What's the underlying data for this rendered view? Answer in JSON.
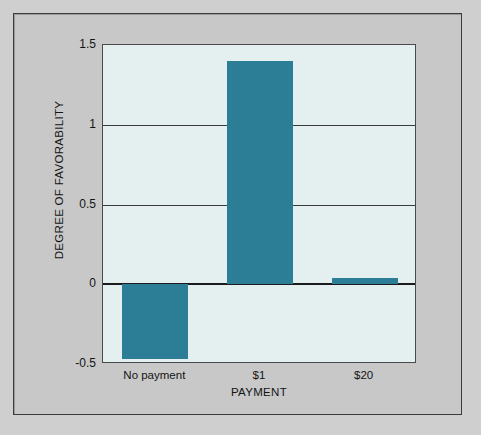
{
  "chart_data": {
    "type": "bar",
    "title": "",
    "subtitle": "",
    "categories": [
      "No payment",
      "$1",
      "$20"
    ],
    "values": [
      -0.47,
      1.4,
      0.04
    ],
    "series": [
      {
        "name": "Degree of favorability",
        "values": [
          -0.47,
          1.4,
          0.04
        ]
      }
    ],
    "xlabel": "PAYMENT",
    "ylabel": "DEGREE OF FAVORABILITY",
    "ylim": [
      -0.5,
      1.5
    ],
    "yticks": [
      1.5,
      1,
      0.5,
      0,
      -0.5
    ],
    "ytick_labels": [
      "1.5",
      "1",
      "0.5",
      "0",
      "-0.5"
    ],
    "grid": true,
    "grid_axis": "y",
    "legend": false,
    "legend_position": "none",
    "bar_color": "#2b7e95",
    "plot_background": "#e4eff0",
    "figure_background": "#c8c8c8",
    "axis_color": "#3a3a3a",
    "zero_line_color": "#1c1c1c"
  },
  "axes": {
    "y_title": "DEGREE OF FAVORABILITY",
    "x_title": "PAYMENT"
  },
  "yticks": [
    {
      "label": "1.5",
      "value": 1.5
    },
    {
      "label": "1",
      "value": 1
    },
    {
      "label": "0.5",
      "value": 0.5
    },
    {
      "label": "0",
      "value": 0
    },
    {
      "label": "-0.5",
      "value": -0.5
    }
  ],
  "xticks": [
    {
      "label": "No payment"
    },
    {
      "label": "$1"
    },
    {
      "label": "$20"
    }
  ]
}
